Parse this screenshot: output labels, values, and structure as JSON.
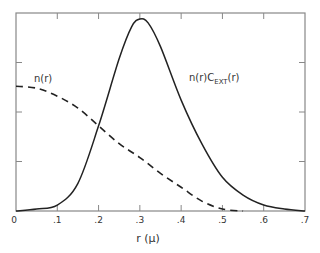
{
  "chart_data": {
    "type": "line",
    "title": "",
    "xlabel": "r (μ)",
    "ylabel": "",
    "xlim": [
      0,
      0.7
    ],
    "ylim": [
      0,
      1
    ],
    "x_ticks": [
      "0",
      ".1",
      ".2",
      ".3",
      ".4",
      ".5",
      ".6",
      ".7"
    ],
    "x_tick_values": [
      0,
      0.1,
      0.2,
      0.3,
      0.4,
      0.5,
      0.6,
      0.7
    ],
    "y_tick_values": [
      0.25,
      0.5,
      0.75
    ],
    "y_tick_labels_shown": false,
    "grid": false,
    "legend": "inline curve labels",
    "series": [
      {
        "name": "n(r)",
        "style": "dashed",
        "x": [
          0,
          0.05,
          0.1,
          0.15,
          0.2,
          0.25,
          0.3,
          0.35,
          0.4,
          0.45,
          0.5,
          0.55
        ],
        "y": [
          0.63,
          0.62,
          0.58,
          0.52,
          0.43,
          0.34,
          0.27,
          0.19,
          0.12,
          0.05,
          0.01,
          0.0
        ]
      },
      {
        "name": "n(r)C_EXT(r)",
        "style": "solid",
        "x": [
          0,
          0.05,
          0.1,
          0.15,
          0.2,
          0.25,
          0.28,
          0.3,
          0.32,
          0.35,
          0.4,
          0.45,
          0.5,
          0.55,
          0.6,
          0.65,
          0.7
        ],
        "y": [
          0.0,
          0.01,
          0.03,
          0.14,
          0.43,
          0.77,
          0.93,
          0.97,
          0.95,
          0.83,
          0.56,
          0.34,
          0.17,
          0.08,
          0.03,
          0.01,
          0.0
        ]
      }
    ],
    "annotations": [
      {
        "text": "n(r)",
        "near": "dashed curve, upper left"
      },
      {
        "text": "n(r)C_EXT(r)",
        "near": "right flank of solid peak"
      }
    ]
  },
  "labels": {
    "dashed": "n(r)",
    "solid_main": "n(r)C",
    "solid_sub": "EXT",
    "solid_tail": "(r)",
    "xlabel": "r (μ)"
  }
}
